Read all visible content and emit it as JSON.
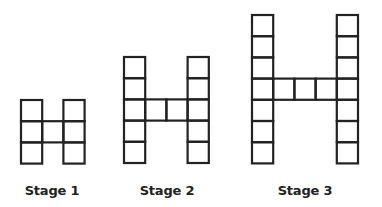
{
  "figure": {
    "stroke_color": "#222222",
    "background": "#ffffff",
    "cell_size": 21.2,
    "stages": [
      {
        "label": "Stage 1",
        "height_cells": 3,
        "bridge_cells": 1,
        "bridge_row": 2,
        "origin": [
          21,
          100
        ],
        "label_center_x": 52,
        "label_top": 183
      },
      {
        "label": "Stage 2",
        "height_cells": 5,
        "bridge_cells": 2,
        "bridge_row": 3,
        "origin": [
          124,
          57
        ],
        "label_center_x": 167,
        "label_top": 183
      },
      {
        "label": "Stage 3",
        "height_cells": 7,
        "bridge_cells": 3,
        "bridge_row": 4,
        "origin": [
          252,
          15
        ],
        "label_center_x": 305,
        "label_top": 183
      }
    ]
  }
}
